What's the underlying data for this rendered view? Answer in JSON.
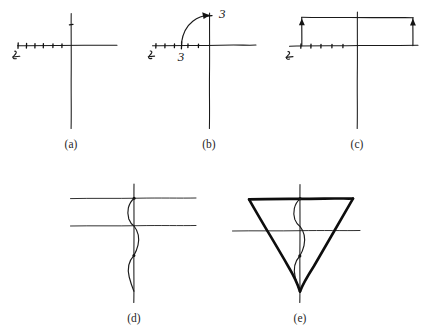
{
  "figure": {
    "background_color": "#ffffff",
    "ink_color": "#1a1a1a",
    "panels": [
      {
        "id": "a",
        "caption": "(a)",
        "description": "hand-drawn coordinate axes with tick marks on the negative x-axis",
        "axis_end_label": "5",
        "tick_count": 6
      },
      {
        "id": "b",
        "caption": "(b)",
        "description": "axes with curved arrow sweeping from x-axis point to y-axis point",
        "axis_end_label": "5",
        "x_point_label": "3",
        "y_point_label": "3"
      },
      {
        "id": "c",
        "caption": "(c)",
        "description": "axes with rectangle above x-axis and upward arrows at left and right sides",
        "axis_end_label": "5"
      },
      {
        "id": "d",
        "caption": "(d)",
        "description": "two horizontal lines crossing a vertical line with a sinusoidal curve along the vertical axis"
      },
      {
        "id": "e",
        "caption": "(e)",
        "description": "sinusoidal curve with bold inverted triangle overlay"
      }
    ]
  },
  "labels": {
    "caption_a": "(a)",
    "caption_b": "(b)",
    "caption_c": "(c)",
    "caption_d": "(d)",
    "caption_e": "(e)",
    "axis_mark_a": "5",
    "axis_mark_b": "5",
    "axis_mark_c": "5",
    "panel_b_x_value": "3",
    "panel_b_y_value": "3"
  }
}
